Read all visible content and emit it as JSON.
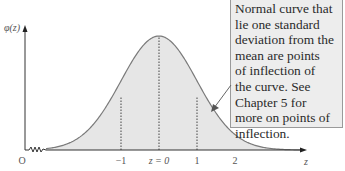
{
  "figure": {
    "y_axis_label": "φ(z)",
    "x_axis_label": "z",
    "origin_label": "O",
    "tick_labels": [
      "−1",
      "z = 0",
      "1",
      "2"
    ],
    "annotation": {
      "lines": [
        "Normal curve that",
        "lie one standard",
        "deviation from the",
        "mean are points",
        "of inflection of",
        "the curve. See",
        "Chapter 5 for",
        "more on points of",
        "inflection."
      ]
    },
    "colors": {
      "curve": "#7a7a7a",
      "fill": "#e6e6e6",
      "axis": "#333333",
      "note_bg": "#ededed",
      "note_border": "#9a9a9a"
    }
  },
  "chart_data": {
    "type": "line",
    "xlabel": "z",
    "ylabel": "φ(z)",
    "x_ticks": [
      -1,
      0,
      1,
      2
    ],
    "tick_labels": [
      "−1",
      "z = 0",
      "1",
      "2"
    ],
    "x": [
      -3,
      -2,
      -1,
      0,
      1,
      2,
      3
    ],
    "values": [
      0.0044,
      0.054,
      0.242,
      0.399,
      0.242,
      0.054,
      0.0044
    ],
    "marked_lines": [
      -1,
      0,
      1
    ],
    "annotation": "Normal curve that lie one standard deviation from the mean are points of inflection of the curve. See Chapter 5 for more on points of inflection.",
    "grid": false
  }
}
